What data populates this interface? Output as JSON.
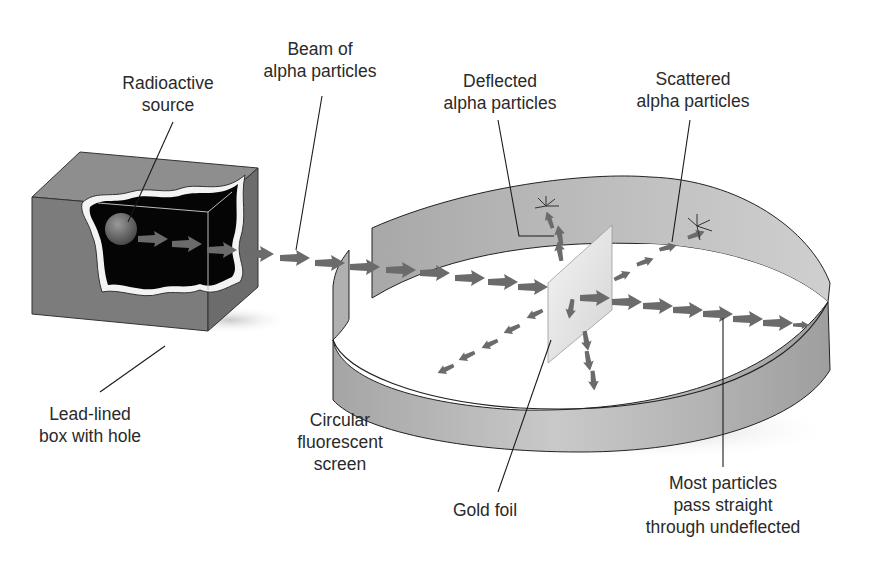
{
  "diagram": {
    "colors": {
      "box": "#7a7a7a",
      "box_top": "#8c8c8c",
      "box_side": "#6a6a6a",
      "cavity": "#050505",
      "lining": "#f2f2f2",
      "screen": "#b8b8b8",
      "arrow": "#6b6b6b",
      "foil": "#e6e6e6",
      "line": "#1a1a1a",
      "text": "#2a2a2a"
    },
    "labels": {
      "beam": {
        "line1": "Beam of",
        "line2": "alpha particles"
      },
      "source": {
        "line1": "Radioactive",
        "line2": "source"
      },
      "deflected": {
        "line1": "Deflected",
        "line2": "alpha particles"
      },
      "scattered": {
        "line1": "Scattered",
        "line2": "alpha particles"
      },
      "box": {
        "line1": "Lead-lined",
        "line2": "box with hole"
      },
      "screen": {
        "line1": "Circular",
        "line2": "fluorescent",
        "line3": "screen"
      },
      "foil": {
        "line1": "Gold foil"
      },
      "undeflected": {
        "line1": "Most particles",
        "line2": "pass straight",
        "line3": "through undeflected"
      }
    }
  }
}
